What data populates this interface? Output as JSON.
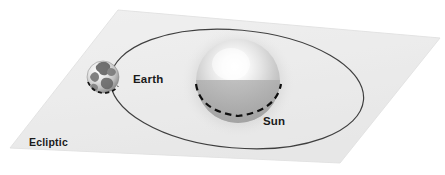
{
  "figure": {
    "background_color": "#ffffff"
  },
  "labels": {
    "earth": "Earth",
    "sun": "Sun",
    "ecliptic": "Ecliptic"
  },
  "colors": {
    "plane_fill": "#eeeeee",
    "plane_edge": "#d8d8d8",
    "orbit_line": "#3a3a3a",
    "label_text": "#1a1a1a",
    "sun_highlight": "#fdfdfd",
    "sun_mid": "#d2d2d2",
    "sun_shadow": "#9a9a9a",
    "earth_light": "#f2f2f2",
    "earth_dark": "#6b6b6b",
    "background": "#ffffff"
  },
  "geometry": {
    "plane_corners": "118,10 440,38 340,163 10,148",
    "orbit_center_x": 237,
    "orbit_center_y": 89,
    "orbit_radius_x": 127,
    "orbit_radius_y": 59,
    "orbit_rotation_deg": 5,
    "sun_center_x": 238,
    "sun_center_y": 81,
    "sun_radius": 42,
    "earth_center_x": 103,
    "earth_center_y": 77,
    "earth_radius": 16
  },
  "elements": {
    "plane_name": "ecliptic-plane",
    "orbit_name": "earth-orbit-ellipse",
    "sun_name": "sun-sphere",
    "earth_name": "earth-sphere"
  }
}
